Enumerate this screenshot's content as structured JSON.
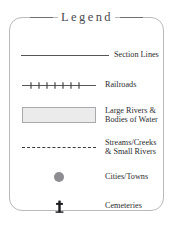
{
  "legend": {
    "title": "Legend",
    "items": [
      {
        "symbol": "solid-line",
        "label": "Section Lines"
      },
      {
        "symbol": "hatched-line",
        "label": "Railroads"
      },
      {
        "symbol": "filled-rectangle",
        "label": "Large Rivers &\nBodies of Water"
      },
      {
        "symbol": "dashed-line",
        "label": "Streams/Creeks\n& Small Rivers"
      },
      {
        "symbol": "filled-circle",
        "label": "Cities/Towns"
      },
      {
        "symbol": "cross",
        "label": "Cemeteries"
      }
    ]
  },
  "colors": {
    "border": "#b9b9bd",
    "line": "#55555a",
    "water_fill": "#ebebeb",
    "water_border": "#a8a8ad",
    "dot": "#8d8d92",
    "text": "#2b2b2e",
    "title_text": "#4a4a4f",
    "background": "#ffffff"
  }
}
